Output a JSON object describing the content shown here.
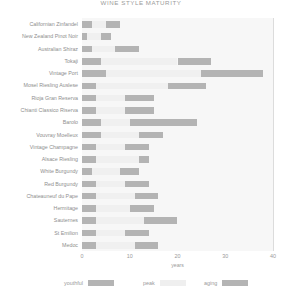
{
  "chart_data": {
    "type": "bar",
    "title": "WINE STYLE MATURITY",
    "xlabel": "years",
    "ylabel": "",
    "xlim": [
      0,
      40
    ],
    "xticks": [
      0,
      10,
      20,
      30,
      40
    ],
    "grid": true,
    "legend_position": "bottom",
    "legend": [
      "youthful",
      "peak",
      "aging"
    ],
    "colors": {
      "youthful": "#b4b4b4",
      "peak": "#f0f0f0",
      "aging": "#b4b4b4",
      "grid": "#dcdcdc",
      "band": "#f7f7f7",
      "text": "#8e8e8e"
    },
    "categories": [
      "Californian Zinfandel",
      "New Zealand Pinot Noir",
      "Australian Shiraz",
      "Tokaji",
      "Vintage Port",
      "Mosel Riesling Auslese",
      "Rioja Gran Reserva",
      "Chianti Classico Riserva",
      "Barolo",
      "Vouvray Moelleux",
      "Vintage Champagne",
      "Alsace Riesling",
      "White Burgundy",
      "Red Burgundy",
      "Chateauneuf du Pape",
      "Hermitage",
      "Sauternes",
      "St Emilion",
      "Medoc"
    ],
    "series": [
      {
        "name": "youthful",
        "ranges": [
          [
            0,
            2
          ],
          [
            0,
            1
          ],
          [
            0,
            2
          ],
          [
            0,
            4
          ],
          [
            0,
            5
          ],
          [
            0,
            3
          ],
          [
            0,
            3
          ],
          [
            0,
            3
          ],
          [
            0,
            4
          ],
          [
            0,
            4
          ],
          [
            0,
            3
          ],
          [
            0,
            3
          ],
          [
            0,
            2
          ],
          [
            0,
            3
          ],
          [
            0,
            3
          ],
          [
            0,
            3
          ],
          [
            0,
            3
          ],
          [
            0,
            3
          ],
          [
            0,
            3
          ]
        ]
      },
      {
        "name": "peak",
        "ranges": [
          [
            2,
            5
          ],
          [
            1,
            4
          ],
          [
            2,
            7
          ],
          [
            4,
            20
          ],
          [
            5,
            25
          ],
          [
            3,
            18
          ],
          [
            3,
            9
          ],
          [
            3,
            9
          ],
          [
            4,
            10
          ],
          [
            4,
            12
          ],
          [
            3,
            9
          ],
          [
            3,
            12
          ],
          [
            2,
            8
          ],
          [
            3,
            9
          ],
          [
            3,
            11
          ],
          [
            3,
            10
          ],
          [
            3,
            13
          ],
          [
            3,
            9
          ],
          [
            3,
            11
          ]
        ]
      },
      {
        "name": "aging",
        "ranges": [
          [
            5,
            8
          ],
          [
            4,
            6
          ],
          [
            7,
            12
          ],
          [
            20,
            27
          ],
          [
            25,
            38
          ],
          [
            18,
            26
          ],
          [
            9,
            15
          ],
          [
            9,
            15
          ],
          [
            10,
            24
          ],
          [
            12,
            17
          ],
          [
            9,
            14
          ],
          [
            12,
            14
          ],
          [
            8,
            12
          ],
          [
            9,
            14
          ],
          [
            11,
            16
          ],
          [
            10,
            15
          ],
          [
            13,
            20
          ],
          [
            9,
            14
          ],
          [
            11,
            16
          ]
        ]
      }
    ]
  }
}
